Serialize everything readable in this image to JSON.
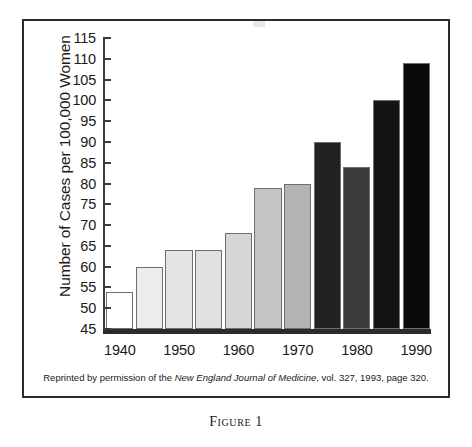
{
  "figure": {
    "caption": "Figure 1",
    "credit_prefix": "Reprinted by permission of the ",
    "credit_source": "New England Journal of Medicine",
    "credit_suffix": ", vol. 327, 1993, page 320."
  },
  "chart_data": {
    "type": "bar",
    "title": "",
    "xlabel": "",
    "ylabel": "Number of Cases per 100,000 Women",
    "ylim": [
      45,
      115
    ],
    "ytick_step": 5,
    "yticks": [
      45,
      50,
      55,
      60,
      65,
      70,
      75,
      80,
      85,
      90,
      95,
      100,
      105,
      110,
      115
    ],
    "ytick_labels": [
      "45",
      "50",
      "55",
      "60",
      "65",
      "70",
      "75",
      "80",
      "85",
      "90",
      "95",
      "100",
      "105",
      "110",
      "115"
    ],
    "grid": false,
    "legend": "none",
    "x": [
      1940,
      1945,
      1950,
      1955,
      1960,
      1965,
      1970,
      1975,
      1980,
      1985,
      1990
    ],
    "xtick_labels": [
      "1940",
      "1950",
      "1960",
      "1970",
      "1980",
      "1990"
    ],
    "xtick_at_bar_index": [
      0,
      2,
      4,
      6,
      8,
      10
    ],
    "values": [
      54,
      60,
      64,
      64,
      68,
      79,
      80,
      90,
      84,
      100,
      109
    ],
    "bar_colors": [
      "#ffffff",
      "#ececec",
      "#e4e4e4",
      "#e0e0e0",
      "#d5d5d5",
      "#c4c4c4",
      "#b4b4b4",
      "#222222",
      "#3c3c3c",
      "#141414",
      "#0a0a0a"
    ]
  }
}
